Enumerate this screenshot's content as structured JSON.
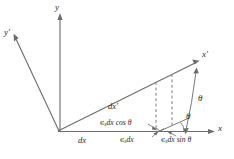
{
  "figure": {
    "type": "geometry-diagram",
    "background_color": "#ffffff",
    "line_color": "#6b6b6b",
    "text_color": "#2b2b2b",
    "axes": [
      {
        "name": "y-axis",
        "label": "y",
        "prime": false
      },
      {
        "name": "y-prime-axis",
        "label": "y",
        "prime": true
      },
      {
        "name": "x-axis",
        "label": "x",
        "prime": false
      },
      {
        "name": "x-prime-axis",
        "label": "x",
        "prime": true
      }
    ],
    "angles": [
      {
        "name": "theta-upper",
        "label": "θ"
      },
      {
        "name": "theta-lower",
        "label": "θ"
      }
    ],
    "lengths": {
      "dx_label": "dx",
      "dx_prime_label": "dx",
      "dx_prime_has_prime": true
    },
    "components": {
      "horizontal": {
        "epsilon": "ϵ",
        "subscript": "x",
        "expression": "dx cos θ",
        "full": "ϵx dx cos θ"
      },
      "total": {
        "epsilon": "ϵ",
        "subscript": "x",
        "expression": "dx",
        "full": "ϵx dx"
      },
      "vertical": {
        "epsilon": "ϵ",
        "subscript": "x",
        "expression": "dx sin θ",
        "full": "ϵx dx sin θ"
      }
    }
  }
}
